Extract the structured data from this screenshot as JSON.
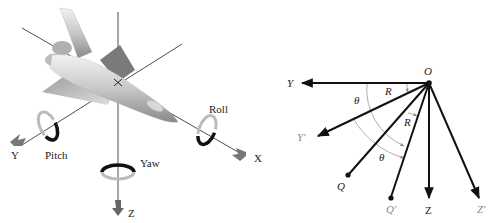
{
  "left_figure": {
    "title": "Aircraft rotation axes",
    "axes": {
      "x_label": "X",
      "y_label": "Y",
      "z_label": "Z"
    },
    "rotations": {
      "roll_label": "Roll",
      "pitch_label": "Pitch",
      "yaw_label": "Yaw"
    }
  },
  "right_figure": {
    "title": "Rotation of axes about origin",
    "origin_label": "O",
    "labels": {
      "y": "Y",
      "y_prime": "Y′",
      "z": "Z",
      "z_prime": "Z′",
      "q": "Q",
      "q_prime": "Q′",
      "r1": "R",
      "r2": "R",
      "theta1": "θ",
      "theta2": "θ"
    }
  },
  "colors": {
    "line": "#111111",
    "arc": "#999999",
    "arrow_grey": "#777777"
  }
}
